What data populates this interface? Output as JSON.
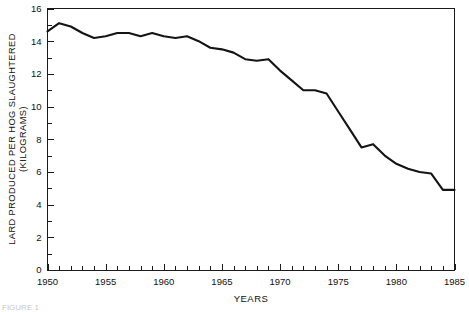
{
  "figure": {
    "background_color": "#ffffff",
    "line_color": "#141414",
    "axis_color": "#1a1a1a",
    "caption": "FIGURE 1"
  },
  "axes": {
    "x_title": "YEARS",
    "y_title_line1": "LARD PRODUCED PER HOG SLAUGHTERED",
    "y_title_line2": "(KILOGRAMS)",
    "x_tick_labels": [
      "1950",
      "1955",
      "1960",
      "1965",
      "1970",
      "1975",
      "1980",
      "1985"
    ],
    "y_tick_labels": [
      "0",
      "2",
      "4",
      "6",
      "8",
      "10",
      "12",
      "14",
      "16"
    ]
  },
  "chart_data": {
    "type": "line",
    "title": "",
    "subtitle": "",
    "xlabel": "YEARS",
    "ylabel": "LARD PRODUCED PER HOG SLAUGHTERED (KILOGRAMS)",
    "xlim": [
      1950,
      1985
    ],
    "ylim": [
      0,
      16
    ],
    "x_major_ticks": [
      1950,
      1955,
      1960,
      1965,
      1970,
      1975,
      1980,
      1985
    ],
    "x_minor_tick_step": 1,
    "y_major_ticks": [
      0,
      2,
      4,
      6,
      8,
      10,
      12,
      14,
      16
    ],
    "y_minor_tick_step": 1,
    "grid": false,
    "legend": false,
    "legend_position": "none",
    "frame": "full-box",
    "x": [
      1950,
      1951,
      1952,
      1953,
      1954,
      1955,
      1956,
      1957,
      1958,
      1959,
      1960,
      1961,
      1962,
      1963,
      1964,
      1965,
      1966,
      1967,
      1968,
      1969,
      1970,
      1971,
      1972,
      1973,
      1974,
      1975,
      1976,
      1977,
      1978,
      1979,
      1980,
      1981,
      1982,
      1983,
      1984,
      1985
    ],
    "series": [
      {
        "name": "Lard produced per hog slaughtered",
        "units": "kilograms",
        "values": [
          14.6,
          15.1,
          14.9,
          14.5,
          14.2,
          14.3,
          14.5,
          14.5,
          14.3,
          14.5,
          14.3,
          14.2,
          14.3,
          14.0,
          13.6,
          13.5,
          13.3,
          12.9,
          12.8,
          12.9,
          12.2,
          11.6,
          11.0,
          11.0,
          10.8,
          9.7,
          8.6,
          7.5,
          7.7,
          7.0,
          6.5,
          6.2,
          6.0,
          5.9,
          4.9,
          4.9
        ]
      }
    ]
  }
}
